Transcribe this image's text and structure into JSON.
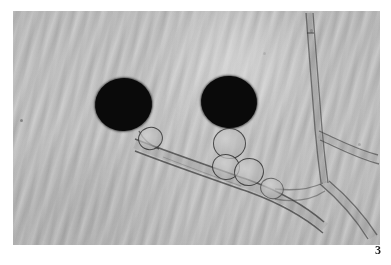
{
  "figure": {
    "number_label": "3",
    "caption_text": "",
    "modality": "light-micrograph",
    "color_mode": "grayscale"
  },
  "plate": {
    "background_color": "#ffffff",
    "field_color": "#bcbcbc",
    "field_dark_color": "#a9a9a9",
    "structure_outline_color": "#2d2d2d",
    "spore_color": "#0a0a0a",
    "left_px": 13,
    "top_px": 11,
    "width_px": 367,
    "height_px": 234
  },
  "specimen": {
    "description": "Two dark spherical spores borne on hyphae with a cluster of vesicles and branching filaments",
    "spores": [
      {
        "name": "spore-left",
        "cx_px": 110,
        "cy_px": 93,
        "rx_px": 28,
        "ry_px": 26,
        "fill": "#0a0a0a"
      },
      {
        "name": "spore-right",
        "cx_px": 216,
        "cy_px": 91,
        "rx_px": 28,
        "ry_px": 26,
        "fill": "#0a0a0a"
      }
    ],
    "vesicles": [
      {
        "name": "vesicle-left-basal",
        "cx_px": 136,
        "cy_px": 126,
        "rx_px": 11,
        "ry_px": 10
      },
      {
        "name": "vesicle-right-upper",
        "cx_px": 215,
        "cy_px": 131,
        "rx_px": 15,
        "ry_px": 14
      },
      {
        "name": "vesicle-right-mid",
        "cx_px": 212,
        "cy_px": 155,
        "rx_px": 12,
        "ry_px": 11
      },
      {
        "name": "vesicle-right-lower",
        "cx_px": 235,
        "cy_px": 160,
        "rx_px": 13,
        "ry_px": 12
      },
      {
        "name": "vesicle-right-distal",
        "cx_px": 258,
        "cy_px": 177,
        "rx_px": 10,
        "ry_px": 9
      }
    ],
    "hyphae": [
      {
        "name": "hypha-main-diagonal",
        "path": "M 120 136 C 160 150, 200 164, 250 180 C 280 190, 300 200, 318 214"
      },
      {
        "name": "hypha-vertical-top",
        "path": "M 298 14 C 300 48, 303 86, 306 120 C 308 142, 310 158, 312 172"
      },
      {
        "name": "hypha-right-branch-upper",
        "path": "M 308 128 C 326 136, 344 146, 362 152"
      },
      {
        "name": "hypha-right-branch-lower",
        "path": "M 312 172 C 330 186, 348 202, 362 220"
      },
      {
        "name": "hypha-left-stub",
        "path": "M 128 134 C 136 144, 144 150, 152 152"
      }
    ],
    "background_texture": "fine diagonal striations, upper-left to lower-right"
  }
}
